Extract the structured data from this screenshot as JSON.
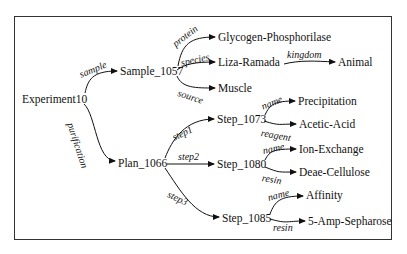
{
  "diagram": {
    "type": "tree",
    "root": "Experiment10",
    "nodes": {
      "experiment": "Experiment10",
      "sample": "Sample_1057",
      "plan": "Plan_1066",
      "glycogen": "Glycogen-Phosphorilase",
      "liza": "Liza-Ramada",
      "animal": "Animal",
      "muscle": "Muscle",
      "step1073": "Step_1073",
      "precipitation": "Precipitation",
      "acetic": "Acetic-Acid",
      "step1080": "Step_1080",
      "ionexchange": "Ion-Exchange",
      "deae": "Deae-Cellulose",
      "step1085": "Step_1085",
      "affinity": "Affinity",
      "sepharose": "5-Amp-Sepharose"
    },
    "edges": {
      "sample": "sample",
      "purification": "purification",
      "protein": "protein",
      "species": "species",
      "source": "source",
      "kingdom": "kingdom",
      "step1": "step1",
      "step2": "step2",
      "step3": "step3",
      "name1073": "name",
      "reagent": "reagent",
      "name1080": "name",
      "resin1080": "resin",
      "name1085": "name",
      "resin1085": "resin"
    },
    "edge_list": [
      {
        "from": "Experiment10",
        "to": "Sample_1057",
        "label": "sample"
      },
      {
        "from": "Experiment10",
        "to": "Plan_1066",
        "label": "purification"
      },
      {
        "from": "Sample_1057",
        "to": "Glycogen-Phosphorilase",
        "label": "protein"
      },
      {
        "from": "Sample_1057",
        "to": "Liza-Ramada",
        "label": "species"
      },
      {
        "from": "Liza-Ramada",
        "to": "Animal",
        "label": "kingdom"
      },
      {
        "from": "Sample_1057",
        "to": "Muscle",
        "label": "source"
      },
      {
        "from": "Plan_1066",
        "to": "Step_1073",
        "label": "step1"
      },
      {
        "from": "Plan_1066",
        "to": "Step_1080",
        "label": "step2"
      },
      {
        "from": "Plan_1066",
        "to": "Step_1085",
        "label": "step3"
      },
      {
        "from": "Step_1073",
        "to": "Precipitation",
        "label": "name"
      },
      {
        "from": "Step_1073",
        "to": "Acetic-Acid",
        "label": "reagent"
      },
      {
        "from": "Step_1080",
        "to": "Ion-Exchange",
        "label": "name"
      },
      {
        "from": "Step_1080",
        "to": "Deae-Cellulose",
        "label": "resin"
      },
      {
        "from": "Step_1085",
        "to": "Affinity",
        "label": "name"
      },
      {
        "from": "Step_1085",
        "to": "5-Amp-Sepharose",
        "label": "resin"
      }
    ]
  }
}
